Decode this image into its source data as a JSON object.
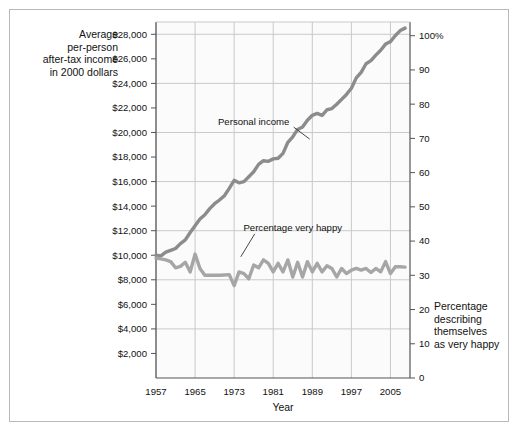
{
  "chart_data": {
    "type": "line",
    "title": "",
    "xlabel": "Year",
    "ylabel_left": "Average per-person after-tax income in 2000 dollars",
    "ylabel_right": "Percentage describing themselves as very happy",
    "ylabel_left_lines": [
      "Average",
      "per-person",
      "after-tax income",
      "in 2000 dollars"
    ],
    "ylabel_right_lines": [
      "Percentage",
      "describing",
      "themselves",
      "as very happy"
    ],
    "grid": true,
    "legend_position": "inline-annotations",
    "xlim": [
      1957,
      2009
    ],
    "xticks": [
      1957,
      1965,
      1973,
      1981,
      1989,
      1997,
      2005
    ],
    "xticklabels": [
      "1957",
      "1965",
      "1973",
      "1981",
      "1989",
      "1997",
      "2005"
    ],
    "y_left_lim": [
      0,
      29000
    ],
    "y_left_ticks": [
      2000,
      4000,
      6000,
      8000,
      10000,
      12000,
      14000,
      16000,
      18000,
      20000,
      22000,
      24000,
      26000,
      28000
    ],
    "y_left_ticklabels": [
      "$2,000",
      "$4,000",
      "$6,000",
      "$8,000",
      "$10,000",
      "$12,000",
      "$14,000",
      "$16,000",
      "$18,000",
      "$20,000",
      "$22,000",
      "$24,000",
      "$26,000",
      "$28,000"
    ],
    "y_right_lim": [
      0,
      104
    ],
    "y_right_ticks": [
      0,
      10,
      20,
      30,
      40,
      50,
      60,
      70,
      80,
      90,
      100
    ],
    "y_right_ticklabels": [
      "0",
      "10",
      "20",
      "30",
      "40",
      "50",
      "60",
      "70",
      "80",
      "90",
      "100%"
    ],
    "gridlines_y_left": [
      4000,
      8000,
      12000,
      16000,
      20000,
      24000,
      28000
    ],
    "series": [
      {
        "name": "Personal income",
        "axis": "left",
        "color": "#8c8c8c",
        "label_x": 1977,
        "label_y": 20600,
        "points": [
          [
            1957,
            10000
          ],
          [
            1958,
            9950
          ],
          [
            1959,
            10250
          ],
          [
            1960,
            10400
          ],
          [
            1961,
            10550
          ],
          [
            1962,
            10950
          ],
          [
            1963,
            11250
          ],
          [
            1964,
            11850
          ],
          [
            1965,
            12400
          ],
          [
            1966,
            12950
          ],
          [
            1967,
            13300
          ],
          [
            1968,
            13800
          ],
          [
            1969,
            14200
          ],
          [
            1970,
            14500
          ],
          [
            1971,
            14850
          ],
          [
            1972,
            15450
          ],
          [
            1973,
            16100
          ],
          [
            1974,
            15900
          ],
          [
            1975,
            16000
          ],
          [
            1976,
            16400
          ],
          [
            1977,
            16800
          ],
          [
            1978,
            17400
          ],
          [
            1979,
            17700
          ],
          [
            1980,
            17650
          ],
          [
            1981,
            17850
          ],
          [
            1982,
            17900
          ],
          [
            1983,
            18300
          ],
          [
            1984,
            19200
          ],
          [
            1985,
            19650
          ],
          [
            1986,
            20250
          ],
          [
            1987,
            20450
          ],
          [
            1988,
            21000
          ],
          [
            1989,
            21400
          ],
          [
            1990,
            21550
          ],
          [
            1991,
            21400
          ],
          [
            1992,
            21850
          ],
          [
            1993,
            21950
          ],
          [
            1994,
            22300
          ],
          [
            1995,
            22700
          ],
          [
            1996,
            23100
          ],
          [
            1997,
            23600
          ],
          [
            1998,
            24450
          ],
          [
            1999,
            24900
          ],
          [
            2000,
            25600
          ],
          [
            2001,
            25850
          ],
          [
            2002,
            26300
          ],
          [
            2003,
            26700
          ],
          [
            2004,
            27200
          ],
          [
            2005,
            27400
          ],
          [
            2006,
            27900
          ],
          [
            2007,
            28300
          ],
          [
            2008,
            28500
          ]
        ]
      },
      {
        "name": "Percentage very happy",
        "axis": "right",
        "color": "#a6a6a6",
        "label_x": 1985,
        "label_y": 43,
        "points": [
          [
            1957,
            35.0
          ],
          [
            1958,
            34.8
          ],
          [
            1959,
            34.5
          ],
          [
            1960,
            34.0
          ],
          [
            1961,
            32.2
          ],
          [
            1962,
            32.6
          ],
          [
            1963,
            33.8
          ],
          [
            1964,
            31.0
          ],
          [
            1965,
            36.2
          ],
          [
            1966,
            32.0
          ],
          [
            1967,
            30.0
          ],
          [
            1968,
            30.0
          ],
          [
            1969,
            30.0
          ],
          [
            1970,
            30.0
          ],
          [
            1971,
            30.1
          ],
          [
            1972,
            30.2
          ],
          [
            1973,
            27.0
          ],
          [
            1974,
            31.0
          ],
          [
            1975,
            30.5
          ],
          [
            1976,
            29.0
          ],
          [
            1977,
            33.0
          ],
          [
            1978,
            32.2
          ],
          [
            1979,
            34.5
          ],
          [
            1980,
            33.5
          ],
          [
            1981,
            31.0
          ],
          [
            1982,
            33.5
          ],
          [
            1983,
            31.0
          ],
          [
            1984,
            34.5
          ],
          [
            1985,
            29.5
          ],
          [
            1986,
            33.8
          ],
          [
            1987,
            29.5
          ],
          [
            1988,
            34.0
          ],
          [
            1989,
            31.0
          ],
          [
            1990,
            33.5
          ],
          [
            1991,
            31.0
          ],
          [
            1992,
            32.8
          ],
          [
            1993,
            32.0
          ],
          [
            1994,
            29.5
          ],
          [
            1995,
            32.0
          ],
          [
            1996,
            30.5
          ],
          [
            1997,
            31.5
          ],
          [
            1998,
            32.0
          ],
          [
            1999,
            31.5
          ],
          [
            2000,
            32.0
          ],
          [
            2001,
            30.8
          ],
          [
            2002,
            32.0
          ],
          [
            2003,
            31.0
          ],
          [
            2004,
            34.0
          ],
          [
            2005,
            30.5
          ],
          [
            2006,
            32.5
          ],
          [
            2007,
            32.5
          ],
          [
            2008,
            32.4
          ]
        ]
      }
    ]
  },
  "colors": {
    "frame": "#b9b9b9",
    "axis": "#555555",
    "grid": "#c9c9c9",
    "plot_bg": "#fbfbfb",
    "income_line": "#8c8c8c",
    "happy_line": "#a6a6a6",
    "text": "#111111"
  }
}
